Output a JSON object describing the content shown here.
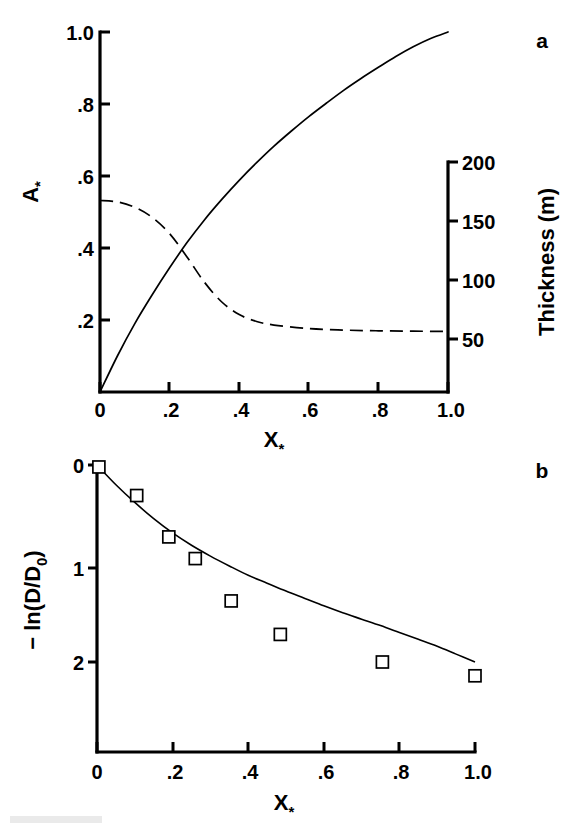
{
  "figure": {
    "panels": [
      {
        "id": "a",
        "label": "a",
        "left_axis": {
          "title": "A",
          "title_subscript": "*",
          "ticks": [
            "1.0",
            ".8",
            ".6",
            ".4",
            ".2",
            ""
          ],
          "tick_values": [
            1.0,
            0.8,
            0.6,
            0.4,
            0.2,
            0.0
          ],
          "range": [
            0.0,
            1.0
          ]
        },
        "right_axis": {
          "title": "Thickness (m)",
          "ticks": [
            "200",
            "150",
            "100",
            "50"
          ],
          "tick_values": [
            200,
            150,
            100,
            50
          ],
          "range": [
            0,
            200
          ]
        },
        "x_axis": {
          "title": "X",
          "title_subscript": "*",
          "ticks": [
            "0",
            ".2",
            ".4",
            ".6",
            ".8",
            "1.0"
          ],
          "tick_values": [
            0.0,
            0.2,
            0.4,
            0.6,
            0.8,
            1.0
          ],
          "range": [
            0.0,
            1.0
          ]
        }
      },
      {
        "id": "b",
        "label": "b",
        "left_axis": {
          "title": "− ln(D/D",
          "title_subscript": "0",
          "title_suffix": ")",
          "ticks": [
            "0",
            "1",
            "2"
          ],
          "tick_values": [
            0,
            1,
            2
          ],
          "range": [
            0,
            2.9
          ]
        },
        "x_axis": {
          "title": "X",
          "title_subscript": "*",
          "ticks": [
            "0",
            ".2",
            ".4",
            ".6",
            ".8",
            "1.0"
          ],
          "tick_values": [
            0.0,
            0.2,
            0.4,
            0.6,
            0.8,
            1.0
          ],
          "range": [
            0.0,
            1.0
          ]
        }
      }
    ]
  },
  "chart_data": [
    {
      "type": "line",
      "panel": "a",
      "title": "",
      "xlabel": "X*",
      "ylabel": "A*",
      "ylabel_right": "Thickness (m)",
      "xlim": [
        0.0,
        1.0
      ],
      "ylim": [
        0.0,
        1.0
      ],
      "ylim_right": [
        0,
        200
      ],
      "grid": false,
      "legend": "none",
      "series": [
        {
          "name": "A*",
          "style": "solid",
          "axis": "left",
          "x": [
            0.0,
            0.05,
            0.1,
            0.15,
            0.2,
            0.25,
            0.3,
            0.35,
            0.4,
            0.45,
            0.5,
            0.55,
            0.6,
            0.65,
            0.7,
            0.75,
            0.8,
            0.85,
            0.9,
            0.95,
            1.0
          ],
          "values": [
            0.0,
            0.1,
            0.19,
            0.27,
            0.345,
            0.415,
            0.478,
            0.535,
            0.588,
            0.637,
            0.683,
            0.725,
            0.765,
            0.802,
            0.838,
            0.871,
            0.902,
            0.932,
            0.959,
            0.982,
            1.0
          ]
        },
        {
          "name": "Thickness",
          "style": "dashed",
          "axis": "right",
          "x": [
            0.0,
            0.05,
            0.1,
            0.15,
            0.2,
            0.25,
            0.3,
            0.35,
            0.4,
            0.45,
            0.5,
            0.6,
            0.7,
            0.8,
            0.9,
            1.0
          ],
          "values_left_scale": [
            0.532,
            0.528,
            0.513,
            0.485,
            0.44,
            0.375,
            0.305,
            0.25,
            0.215,
            0.196,
            0.186,
            0.176,
            0.172,
            0.17,
            0.169,
            0.168
          ],
          "values": [
            172,
            171,
            166,
            157,
            143,
            122,
            99,
            81,
            70,
            64,
            60,
            57,
            56,
            55,
            55,
            54
          ]
        }
      ]
    },
    {
      "type": "scatter",
      "panel": "b",
      "title": "",
      "xlabel": "X*",
      "ylabel": "-ln(D/D0)",
      "xlim": [
        0.0,
        1.0
      ],
      "ylim": [
        0.0,
        2.9
      ],
      "y_inverted": true,
      "grid": false,
      "legend": "none",
      "marker": "open-square",
      "points": [
        {
          "x": 0.005,
          "y": 0.02
        },
        {
          "x": 0.105,
          "y": 0.31
        },
        {
          "x": 0.19,
          "y": 0.73
        },
        {
          "x": 0.26,
          "y": 0.95
        },
        {
          "x": 0.355,
          "y": 1.38
        },
        {
          "x": 0.485,
          "y": 1.72
        },
        {
          "x": 0.755,
          "y": 2.0
        },
        {
          "x": 1.0,
          "y": 2.14
        }
      ],
      "fit": {
        "name": "fit curve",
        "style": "solid",
        "x": [
          0.0,
          0.05,
          0.1,
          0.15,
          0.2,
          0.25,
          0.3,
          0.35,
          0.4,
          0.45,
          0.5,
          0.55,
          0.6,
          0.65,
          0.7,
          0.75,
          0.8,
          0.85,
          0.9,
          0.95,
          1.0
        ],
        "values": [
          0.0,
          0.2,
          0.38,
          0.545,
          0.69,
          0.815,
          0.925,
          1.025,
          1.12,
          1.2,
          1.28,
          1.355,
          1.43,
          1.5,
          1.565,
          1.63,
          1.7,
          1.77,
          1.84,
          1.92,
          2.0
        ]
      }
    }
  ]
}
